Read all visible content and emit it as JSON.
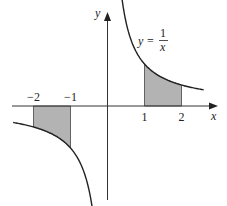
{
  "chart_data": {
    "type": "line",
    "title": "",
    "function": "y = 1/x",
    "equation_label": {
      "lhs": "y =",
      "numerator": "1",
      "denominator": "x"
    },
    "xlabel": "x",
    "ylabel": "y",
    "xlim": [
      -2.9,
      3.0
    ],
    "ylim": [
      -2.3,
      2.3
    ],
    "x_ticks": [
      {
        "value": -2,
        "label": "−2"
      },
      {
        "value": -1,
        "label": "−1"
      },
      {
        "value": 1,
        "label": "1"
      },
      {
        "value": 2,
        "label": "2"
      }
    ],
    "series": [
      {
        "name": "y=1/x (x>0)",
        "x_range": [
          0.37,
          2.6
        ]
      },
      {
        "name": "y=1/x (x<0)",
        "x_range": [
          -2.55,
          -0.37
        ]
      }
    ],
    "shaded_regions": [
      {
        "name": "area-1-to-2",
        "x_from": 1,
        "x_to": 2
      },
      {
        "name": "area-neg2-to-neg1",
        "x_from": -2,
        "x_to": -1
      }
    ],
    "colors": {
      "shade": "#b3b3b3",
      "line": "#222222"
    }
  }
}
